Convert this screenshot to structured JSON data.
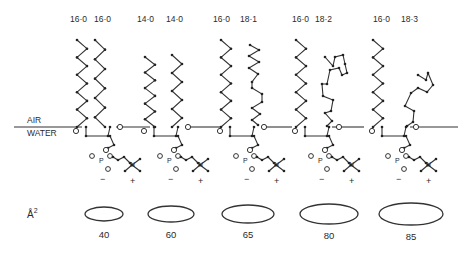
{
  "interface": {
    "upper_label": "AIR",
    "lower_label": "WATER"
  },
  "area_unit_label": "Å",
  "area_unit_superscript": "2",
  "lipids": [
    {
      "chain1": "16:0",
      "chain1_display": "16·0",
      "chain2": "16:0",
      "chain2_display": "16·0",
      "chain2_double_bonds": 0,
      "area": "40",
      "charge_neg": "−",
      "charge_pos": "+"
    },
    {
      "chain1": "14:0",
      "chain1_display": "14·0",
      "chain2": "14:0",
      "chain2_display": "14·0",
      "chain2_double_bonds": 0,
      "area": "60",
      "charge_neg": "−",
      "charge_pos": "+"
    },
    {
      "chain1": "16:0",
      "chain1_display": "16·0",
      "chain2": "18:1",
      "chain2_display": "18·1",
      "chain2_double_bonds": 1,
      "area": "65",
      "charge_neg": "−",
      "charge_pos": "+"
    },
    {
      "chain1": "16:0",
      "chain1_display": "16·0",
      "chain2": "18:2",
      "chain2_display": "18·2",
      "chain2_double_bonds": 2,
      "area": "80",
      "charge_neg": "−",
      "charge_pos": "+"
    },
    {
      "chain1": "16:0",
      "chain1_display": "16·0",
      "chain2": "18:3",
      "chain2_display": "18·3",
      "chain2_double_bonds": 3,
      "area": "85",
      "charge_neg": "−",
      "charge_pos": "+"
    }
  ],
  "head_group_atom_labels": {
    "phosphorus": "P",
    "nitrogen": "N"
  }
}
